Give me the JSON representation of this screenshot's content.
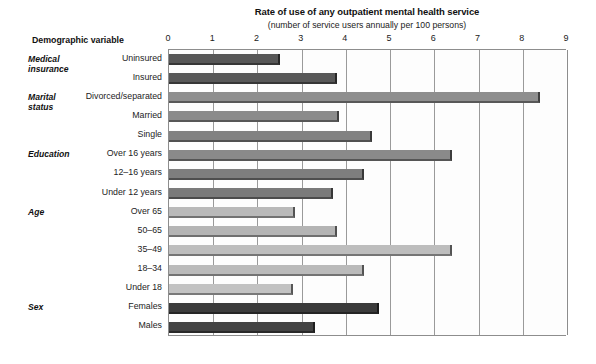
{
  "chart_data": {
    "type": "bar",
    "orientation": "horizontal",
    "title": "Rate of use of any outpatient mental health service",
    "subtitle": "(number of service users annually per 100 persons)",
    "xlabel": "",
    "ylabel": "Demographic variable",
    "row_header": "Demographic variable",
    "xlim": [
      0,
      9
    ],
    "xticks": [
      0,
      1,
      2,
      3,
      4,
      5,
      6,
      7,
      8,
      9
    ],
    "xtick_labels": [
      "0",
      "1",
      "2",
      "3",
      "4",
      "5",
      "6",
      "7",
      "8",
      "9"
    ],
    "grid": true,
    "grid_axis": "x",
    "legend": "none",
    "categories": [
      "Uninsured",
      "Insured",
      "Divorced/separated",
      "Married",
      "Single",
      "Over 16 years",
      "12–16 years",
      "Under 12 years",
      "Over 65",
      "50–65",
      "35–49",
      "18–34",
      "Under 18",
      "Females",
      "Males"
    ],
    "values": [
      2.5,
      3.8,
      8.4,
      3.85,
      4.6,
      6.4,
      4.4,
      3.7,
      2.85,
      3.8,
      6.4,
      4.4,
      2.8,
      4.75,
      3.3
    ],
    "bar_colors": [
      "#575757",
      "#585858",
      "#8e8e8e",
      "#8b8b8b",
      "#828282",
      "#8a8a8a",
      "#7e7e7e",
      "#7a7a7a",
      "#b9b9b9",
      "#b4b4b4",
      "#bdbdbd",
      "#bababa",
      "#c2c2c2",
      "#3b3b3b",
      "#434343"
    ],
    "groups": [
      {
        "label_lines": [
          "Medical",
          "insurance"
        ],
        "start_index": 0,
        "span": 2
      },
      {
        "label_lines": [
          "Marital",
          "status"
        ],
        "start_index": 2,
        "span": 3
      },
      {
        "label_lines": [
          "Education"
        ],
        "start_index": 5,
        "span": 3
      },
      {
        "label_lines": [
          "Age"
        ],
        "start_index": 8,
        "span": 5
      },
      {
        "label_lines": [
          "Sex"
        ],
        "start_index": 13,
        "span": 2
      }
    ]
  },
  "colors": {
    "axis": "#8d8d8d",
    "grid": "#9a9a9a",
    "text": "#1a1a1a",
    "plot_background": "#fdfdfd"
  }
}
